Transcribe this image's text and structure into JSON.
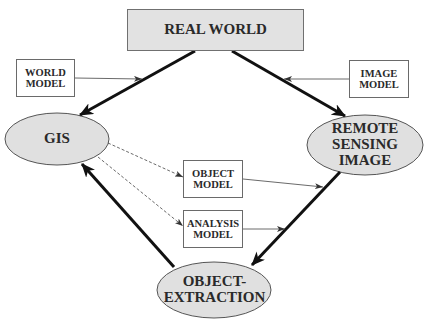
{
  "diagram": {
    "nodes": {
      "real_world": {
        "label": "REAL WORLD",
        "shape": "rectangle",
        "fill": "#e2e2e2"
      },
      "world_model": {
        "label": "WORLD\nMODEL",
        "shape": "rectangle",
        "fill": "#ffffff"
      },
      "image_model": {
        "label": "IMAGE\nMODEL",
        "shape": "rectangle",
        "fill": "#ffffff"
      },
      "gis": {
        "label": "GIS",
        "shape": "ellipse",
        "fill": "#e0e0e0"
      },
      "remote_sensing_image": {
        "label": "REMOTE\nSENSING\nIMAGE",
        "shape": "ellipse",
        "fill": "#e0e0e0"
      },
      "object_model": {
        "label": "OBJECT\nMODEL",
        "shape": "rectangle",
        "fill": "#ffffff"
      },
      "analysis_model": {
        "label": "ANALYSIS\nMODEL",
        "shape": "rectangle",
        "fill": "#ffffff"
      },
      "object_extraction": {
        "label": "OBJECT-\nEXTRACTION",
        "shape": "ellipse",
        "fill": "#e0e0e0"
      }
    },
    "edges": [
      {
        "from": "REAL WORLD",
        "to": "GIS",
        "style": "thick"
      },
      {
        "from": "REAL WORLD",
        "to": "REMOTE SENSING IMAGE",
        "style": "thick"
      },
      {
        "from": "REMOTE SENSING IMAGE",
        "to": "OBJECT-EXTRACTION",
        "style": "thick"
      },
      {
        "from": "OBJECT-EXTRACTION",
        "to": "GIS",
        "style": "thick"
      },
      {
        "from": "WORLD MODEL",
        "to": "REAL WORLD→GIS edge",
        "style": "thin"
      },
      {
        "from": "IMAGE MODEL",
        "to": "REAL WORLD→REMOTE SENSING IMAGE edge",
        "style": "thin"
      },
      {
        "from": "OBJECT MODEL",
        "to": "REMOTE SENSING IMAGE→OBJECT-EXTRACTION edge",
        "style": "thin"
      },
      {
        "from": "ANALYSIS MODEL",
        "to": "REMOTE SENSING IMAGE→OBJECT-EXTRACTION edge",
        "style": "thin"
      },
      {
        "from": "GIS",
        "to": "OBJECT MODEL",
        "style": "dashed"
      },
      {
        "from": "GIS",
        "to": "ANALYSIS MODEL",
        "style": "dashed"
      }
    ],
    "colors": {
      "node_fill": "#e0e0e0",
      "line": "#111111",
      "thin_line": "#555555",
      "border": "#6a6a6a"
    }
  }
}
